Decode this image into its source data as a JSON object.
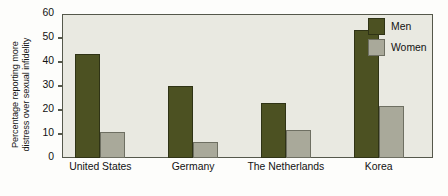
{
  "chart_data": {
    "type": "bar",
    "title": "",
    "xlabel": "",
    "ylabel": "Percentage reporting more\ndistress over sexual infidelity",
    "ylabel_line1": "Percentage reporting more",
    "ylabel_line2": "distress over sexual infidelity",
    "categories": [
      "United States",
      "Germany",
      "The Netherlands",
      "Korea"
    ],
    "series": [
      {
        "name": "Men",
        "color": "#4c5122",
        "values": [
          43.5,
          30.0,
          23.0,
          53.5
        ]
      },
      {
        "name": "Women",
        "color": "#a9a99a",
        "values": [
          11.0,
          6.8,
          11.5,
          21.5
        ]
      }
    ],
    "ylim": [
      0,
      60
    ],
    "yticks": [
      0,
      10,
      20,
      30,
      40,
      50,
      60
    ],
    "ytick_labels": [
      "0",
      "10",
      "20",
      "30",
      "40",
      "50",
      "60"
    ],
    "grid": false,
    "legend_position": "top-right",
    "legend_entries": [
      "Men",
      "Women"
    ],
    "plot_background": "#e9e9e1",
    "axis_color": "#55584b"
  }
}
